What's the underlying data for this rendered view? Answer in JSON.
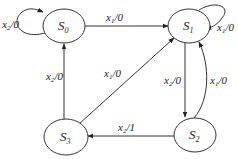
{
  "diagram": {
    "type": "state-transition-diagram",
    "states": [
      {
        "id": "S0",
        "base": "S",
        "sub": "0"
      },
      {
        "id": "S1",
        "base": "S",
        "sub": "1"
      },
      {
        "id": "S2",
        "base": "S",
        "sub": "2"
      },
      {
        "id": "S3",
        "base": "S",
        "sub": "3"
      }
    ],
    "transitions": [
      {
        "from": "S0",
        "to": "S0",
        "input": "x",
        "input_sub": "2",
        "output": "/0"
      },
      {
        "from": "S0",
        "to": "S1",
        "input": "x",
        "input_sub": "1",
        "output": "/0"
      },
      {
        "from": "S1",
        "to": "S1",
        "input": "x",
        "input_sub": "1",
        "output": "/0"
      },
      {
        "from": "S1",
        "to": "S2",
        "input": "x",
        "input_sub": "2",
        "output": "/0"
      },
      {
        "from": "S2",
        "to": "S1",
        "input": "x",
        "input_sub": "1",
        "output": "/0"
      },
      {
        "from": "S2",
        "to": "S3",
        "input": "x",
        "input_sub": "2",
        "output": "/1"
      },
      {
        "from": "S3",
        "to": "S0",
        "input": "x",
        "input_sub": "2",
        "output": "/0"
      },
      {
        "from": "S3",
        "to": "S1",
        "input": "x",
        "input_sub": "1",
        "output": "/0"
      }
    ]
  }
}
